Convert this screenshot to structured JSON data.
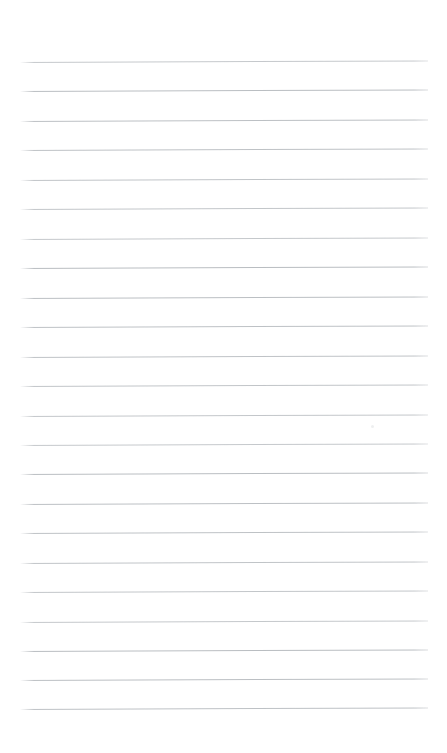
{
  "document": {
    "kind": "lined-paper",
    "title": "",
    "heading": "",
    "body_text": "",
    "page_number": "",
    "header_text": "",
    "footer_text": "",
    "is_blank": "true"
  },
  "page": {
    "width": 447,
    "height": 753,
    "background_color": "#ffffff"
  },
  "ruling": {
    "line_color": "#b9bdc1",
    "line_thickness": 1,
    "line_count": 23,
    "left_x": 20,
    "right_x": 428,
    "first_line_y": 62,
    "line_spacing": 29.4,
    "tilt_degrees": -0.22,
    "top_margin": 62,
    "bottom_margin": 44,
    "line_y_positions": [
      62,
      91,
      121,
      150,
      180,
      209,
      239,
      268,
      298,
      327,
      357,
      386,
      416,
      445,
      474,
      504,
      533,
      563,
      592,
      622,
      651,
      680,
      709
    ]
  },
  "artifacts": {
    "speck": {
      "x": 371,
      "y": 425
    }
  }
}
